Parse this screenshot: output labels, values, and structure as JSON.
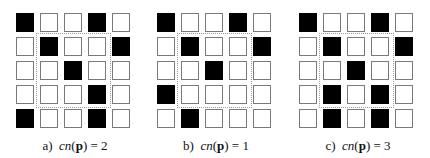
{
  "figures": [
    {
      "id": "a",
      "label": "a)",
      "func": "cn",
      "arg": "p",
      "value": "= 2",
      "grid": [
        [
          1,
          0,
          0,
          1,
          0
        ],
        [
          0,
          1,
          0,
          0,
          1
        ],
        [
          0,
          0,
          1,
          0,
          0
        ],
        [
          0,
          0,
          0,
          1,
          0
        ],
        [
          1,
          0,
          0,
          1,
          0
        ]
      ]
    },
    {
      "id": "b",
      "label": "b)",
      "func": "cn",
      "arg": "p",
      "value": "= 1",
      "grid": [
        [
          1,
          0,
          0,
          1,
          0
        ],
        [
          0,
          1,
          0,
          0,
          1
        ],
        [
          0,
          0,
          1,
          0,
          0
        ],
        [
          1,
          0,
          0,
          0,
          0
        ],
        [
          0,
          1,
          0,
          0,
          0
        ]
      ]
    },
    {
      "id": "c",
      "label": "c)",
      "func": "cn",
      "arg": "p",
      "value": "= 3",
      "grid": [
        [
          1,
          0,
          0,
          1,
          0
        ],
        [
          0,
          1,
          0,
          0,
          1
        ],
        [
          0,
          0,
          1,
          0,
          0
        ],
        [
          0,
          1,
          0,
          1,
          0
        ],
        [
          0,
          1,
          0,
          1,
          0
        ]
      ]
    }
  ],
  "colors": {
    "black": "#000000",
    "white": "#ffffff",
    "border": "#7a7a7a",
    "dash": "#9a9a9a"
  }
}
